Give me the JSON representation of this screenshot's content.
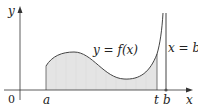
{
  "diagram": {
    "title": "",
    "axes": {
      "x_label": "x",
      "y_label": "y",
      "origin_label": "0"
    },
    "curve_label": "y = f(x)",
    "vertical_line_label": "x = b",
    "ticks": [
      "a",
      "t",
      "b"
    ],
    "shaded_region": "area under y = f(x) from a to t",
    "colors": {
      "axis": "#333333",
      "curve": "#444444",
      "shade": "#e4e4e4",
      "background": "#ffffff"
    }
  }
}
